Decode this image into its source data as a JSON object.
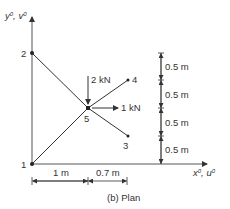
{
  "diagram": {
    "caption": "(b) Plan",
    "axes": {
      "y_label_1": "y",
      "y_sup": "0",
      "y_sep": ", ",
      "y_label_2": "v",
      "x_label_1": "x",
      "x_sup": "0",
      "x_sep": ", ",
      "x_label_2": "u"
    },
    "nodes": [
      {
        "id": "1",
        "label": "1"
      },
      {
        "id": "2",
        "label": "2"
      },
      {
        "id": "3",
        "label": "3"
      },
      {
        "id": "4",
        "label": "4"
      },
      {
        "id": "5",
        "label": "5"
      }
    ],
    "loads": {
      "vertical": "2 kN",
      "horizontal": "1 kN"
    },
    "dimensions": {
      "vertical": [
        "0.5 m",
        "0.5 m",
        "0.5 m",
        "0.5 m"
      ],
      "horizontal": [
        "1 m",
        "0.7 m"
      ]
    },
    "colors": {
      "line": "#333333",
      "text": "#333333"
    }
  }
}
